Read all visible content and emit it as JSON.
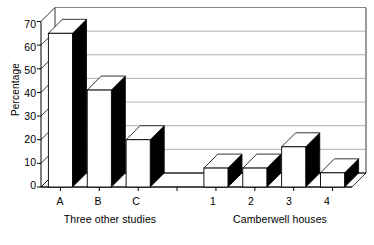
{
  "chart_data": {
    "type": "bar",
    "title": "",
    "subtitle": "",
    "xlabel": "",
    "ylabel": "Percentage",
    "ylim": [
      0,
      70
    ],
    "yticks": [
      0,
      10,
      20,
      30,
      40,
      50,
      60,
      70
    ],
    "ytick_labels": [
      "0",
      "10",
      "20",
      "30",
      "40",
      "50",
      "60",
      "70"
    ],
    "grid": true,
    "grid_axis": "y",
    "legend": false,
    "legend_position": "none",
    "style": "3d-bar",
    "categories": [
      "A",
      "B",
      "C",
      "",
      "1",
      "2",
      "3",
      "4"
    ],
    "values": [
      65,
      41,
      20,
      null,
      8,
      8,
      17,
      6
    ],
    "groups": [
      {
        "label": "Three other studies",
        "categories": [
          "A",
          "B",
          "C"
        ],
        "values": [
          65,
          41,
          20
        ]
      },
      {
        "label": "Camberwell houses",
        "categories": [
          "1",
          "2",
          "3",
          "4"
        ],
        "values": [
          8,
          8,
          17,
          6
        ]
      }
    ],
    "bar_face_color": "#ffffff",
    "bar_side_color": "#000000",
    "bar_edge_color": "#000000",
    "grid_color": "#999999",
    "axis_color": "#000000",
    "background_color": "#ffffff",
    "annotations": []
  },
  "axes": {
    "y_title": "Percentage",
    "y_tick_labels": [
      "70",
      "60",
      "50",
      "40",
      "30",
      "20",
      "10",
      "0"
    ],
    "x_tick_labels": [
      "A",
      "B",
      "C",
      "1",
      "2",
      "3",
      "4"
    ]
  },
  "groups": {
    "left_label": "Three other studies",
    "right_label": "Camberwell houses"
  }
}
